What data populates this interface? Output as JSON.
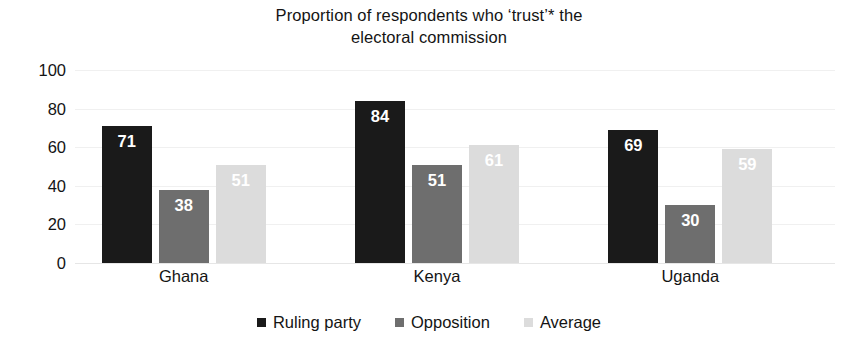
{
  "chart_data": {
    "type": "bar",
    "title": "Proportion of respondents who ‘trust’* the\nelectoral commission",
    "xlabel": "",
    "ylabel": "",
    "ylim": [
      0,
      100
    ],
    "yticks": [
      0,
      20,
      40,
      60,
      80,
      100
    ],
    "grid": true,
    "legend_position": "bottom",
    "categories": [
      "Ghana",
      "Kenya",
      "Uganda"
    ],
    "series": [
      {
        "name": "Ruling party",
        "color": "#1a1a1a",
        "values": [
          71,
          84,
          69
        ]
      },
      {
        "name": "Opposition",
        "color": "#6e6e6e",
        "values": [
          38,
          51,
          30
        ]
      },
      {
        "name": "Average",
        "color": "#dcdcdc",
        "values": [
          51,
          61,
          59
        ]
      }
    ]
  },
  "axis": {
    "y_tick_labels": [
      "100",
      "80",
      "60",
      "40",
      "20",
      "0"
    ]
  },
  "legend": {
    "items": [
      {
        "label": "Ruling party",
        "swatch_name": "legend-swatch-ruling-party"
      },
      {
        "label": "Opposition",
        "swatch_name": "legend-swatch-opposition"
      },
      {
        "label": "Average",
        "swatch_name": "legend-swatch-average"
      }
    ]
  },
  "colors": {
    "ruling_party": "#1a1a1a",
    "opposition": "#6e6e6e",
    "average": "#dcdcdc",
    "gridline": "#f0f0f0",
    "text": "#141414",
    "background": "#ffffff",
    "data_label": "#ffffff"
  }
}
